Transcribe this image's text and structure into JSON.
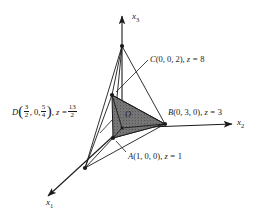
{
  "figure": {
    "type": "3d-coordinate-diagram",
    "background_color": "#ffffff",
    "line_color": "#1a1a1a",
    "shade_color": "#7a7a7a",
    "axes": [
      {
        "id": "x1",
        "name": "x",
        "sub": "1"
      },
      {
        "id": "x2",
        "name": "x",
        "sub": "2"
      },
      {
        "id": "x3",
        "name": "x",
        "sub": "3"
      }
    ],
    "origin": {
      "label": "O"
    },
    "points": {
      "A": {
        "name": "A",
        "coords": "(1, 0, 0)",
        "z_prefix": ", z = ",
        "z_value": "1",
        "full": "A(1, 0, 0), z = 1"
      },
      "B": {
        "name": "B",
        "coords": "(0, 3, 0)",
        "z_prefix": ", z = ",
        "z_value": "3",
        "full": "B(0, 3, 0), z = 3"
      },
      "C": {
        "name": "C",
        "coords": "(0, 0, 2)",
        "z_prefix": ", z = ",
        "z_value": "8",
        "full": "C(0, 0, 2), z = 8"
      },
      "D": {
        "name": "D",
        "open_paren": "(",
        "close_paren": ")",
        "coord_x_num": "3",
        "coord_x_den": "2",
        "coord_y": ", 0, ",
        "coord_z_num": "5",
        "coord_z_den": "4",
        "z_prefix": ", z = ",
        "z_num": "13",
        "z_den": "2",
        "full": "D(3/2, 0, 5/4), z = 13/2"
      }
    }
  }
}
